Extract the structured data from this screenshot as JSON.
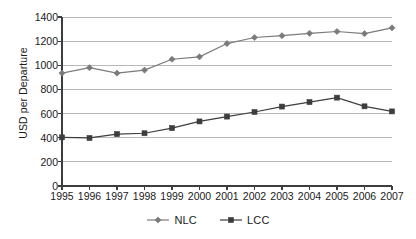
{
  "chart_data": {
    "type": "line",
    "title": "",
    "xlabel": "",
    "ylabel": "USD per Departure",
    "categories": [
      "1995",
      "1996",
      "1997",
      "1998",
      "1999",
      "2000",
      "2001",
      "2002",
      "2003",
      "2004",
      "2005",
      "2006",
      "2007"
    ],
    "ylim": [
      0,
      1400
    ],
    "yticks": [
      0,
      200,
      400,
      600,
      800,
      1000,
      1200,
      1400
    ],
    "ytick_labels": [
      "0",
      "200",
      "400",
      "600",
      "800",
      "1000",
      "1200",
      "1400"
    ],
    "grid": true,
    "grid_axis": "y",
    "legend_position": "bottom",
    "series": [
      {
        "name": "NLC",
        "marker": "diamond",
        "color": "#7a7a7a",
        "values": [
          935,
          980,
          935,
          960,
          1050,
          1070,
          1180,
          1230,
          1245,
          1265,
          1280,
          1262,
          1310
        ]
      },
      {
        "name": "LCC",
        "marker": "square",
        "color": "#3d3d3d",
        "values": [
          403,
          398,
          430,
          437,
          480,
          535,
          575,
          613,
          658,
          695,
          732,
          660,
          618
        ]
      }
    ]
  },
  "colors": {
    "axis": "#3d3d3d",
    "grid": "#b9b9b9",
    "background": "#ffffff",
    "text": "#1a1a1a",
    "nlc": "#7a7a7a",
    "lcc": "#3d3d3d"
  },
  "legend": {
    "items": [
      {
        "label": "NLC",
        "marker": "diamond-marker-icon"
      },
      {
        "label": "LCC",
        "marker": "square-marker-icon"
      }
    ]
  }
}
